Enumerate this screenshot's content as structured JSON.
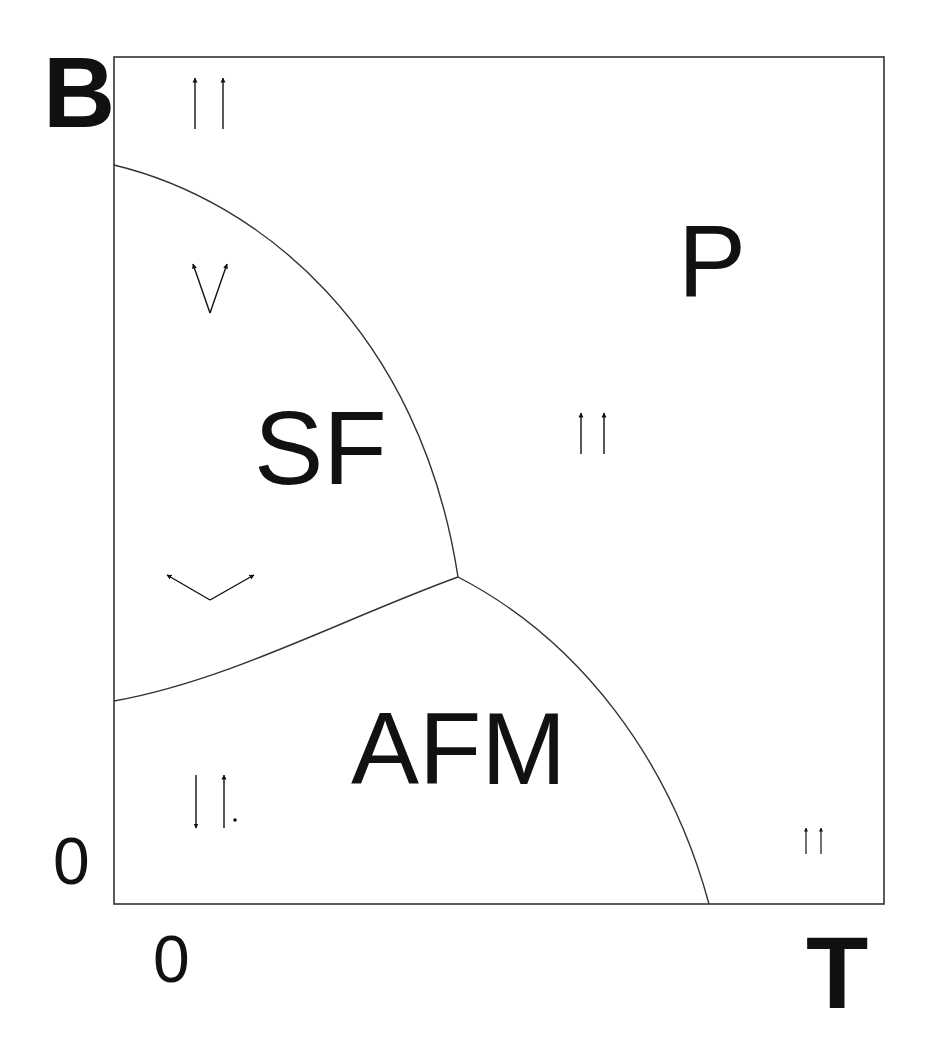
{
  "diagram": {
    "type": "phase-diagram",
    "axes": {
      "y_label": "B",
      "x_label": "T",
      "y_origin_label": "0",
      "x_origin_label": "0"
    },
    "regions": [
      {
        "id": "P",
        "label": "P",
        "spin_arrows": "parallel-up"
      },
      {
        "id": "SF",
        "label": "SF",
        "spin_arrows": "canted"
      },
      {
        "id": "AFM",
        "label": "AFM",
        "spin_arrows": "antiparallel"
      }
    ],
    "spin_symbols": [
      {
        "region": "P",
        "position": "top-left",
        "config": "up-up"
      },
      {
        "region": "SF",
        "position": "upper",
        "config": "narrow-canted"
      },
      {
        "region": "P",
        "position": "center",
        "config": "up-up"
      },
      {
        "region": "SF",
        "position": "lower",
        "config": "wide-canted"
      },
      {
        "region": "AFM",
        "position": "bottom-left",
        "config": "down-up"
      },
      {
        "region": "P",
        "position": "bottom-right",
        "config": "up-up-small"
      }
    ],
    "boundaries": [
      {
        "name": "SF-P boundary",
        "from": "B-axis upper",
        "to": "triple point"
      },
      {
        "name": "AFM-SF boundary",
        "from": "B-axis lower",
        "to": "triple point"
      },
      {
        "name": "AFM-P boundary",
        "from": "triple point",
        "to": "T-axis"
      }
    ],
    "colors": {
      "line": "#333333",
      "text": "#111111",
      "background": "#ffffff"
    }
  }
}
